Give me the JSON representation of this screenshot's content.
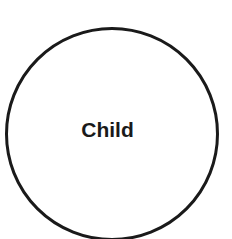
{
  "diagram": {
    "nodes": [
      {
        "shape": "circle",
        "label": "Child",
        "stroke": "#1a1a1a",
        "fill": "#ffffff"
      }
    ]
  }
}
